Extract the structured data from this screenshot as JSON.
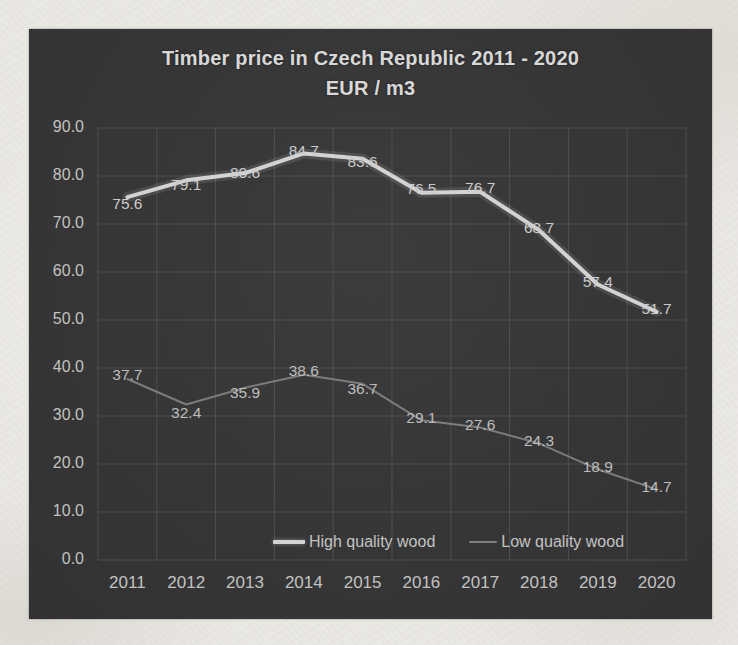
{
  "title": {
    "line1": "Timber price in Czech Republic 2011 - 2020",
    "line2": "EUR / m3"
  },
  "chart_data": {
    "type": "line",
    "title": "Timber price in Czech Republic 2011 - 2020",
    "subtitle": "EUR / m3",
    "categories": [
      "2011",
      "2012",
      "2013",
      "2014",
      "2015",
      "2016",
      "2017",
      "2018",
      "2019",
      "2020"
    ],
    "series": [
      {
        "name": "High quality wood",
        "values": [
          75.6,
          79.1,
          80.6,
          84.7,
          83.6,
          76.5,
          76.7,
          68.7,
          57.4,
          51.7
        ],
        "color": "#d3d3d3",
        "label_color": "#cbcbcb",
        "line_width": 4,
        "label_dy": [
          6,
          4,
          -1,
          -3,
          3,
          -4,
          -4,
          -3,
          -3,
          -3
        ]
      },
      {
        "name": "Low quality wood",
        "values": [
          37.7,
          32.4,
          35.9,
          38.6,
          36.7,
          29.1,
          27.6,
          24.3,
          18.9,
          14.7
        ],
        "color": "#7c7c7c",
        "label_color": "#bdbdbd",
        "line_width": 2,
        "label_dy": [
          -5,
          8,
          5,
          -4,
          5,
          -3,
          -3,
          -3,
          -3,
          -3
        ]
      }
    ],
    "ylim": [
      0,
      90
    ],
    "ytick_step": 10,
    "ytick_labels": [
      "90.0",
      "80.0",
      "70.0",
      "60.0",
      "50.0",
      "40.0",
      "30.0",
      "20.0",
      "10.0",
      "0.0"
    ],
    "grid": true,
    "legend_position": "bottom-inside",
    "legend_items": [
      "High quality wood",
      "Low quality wood"
    ]
  },
  "colors": {
    "chart_bg": "#363636",
    "paper_bg": "#ebe9e4",
    "grid": "#585858",
    "axis_text": "#c2c2c2",
    "title_text": "#d8d8d8"
  }
}
